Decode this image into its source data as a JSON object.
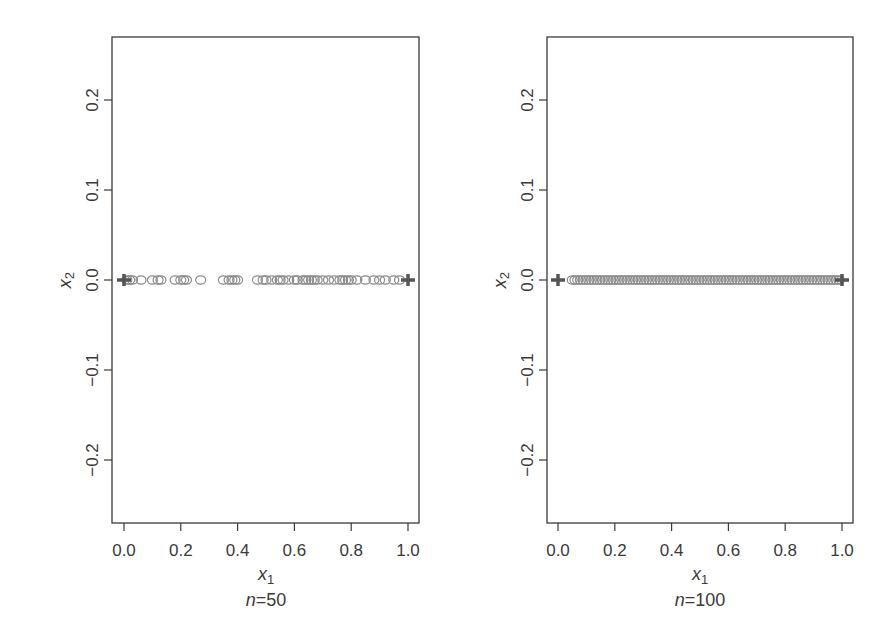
{
  "chart_data": [
    {
      "type": "scatter",
      "title": "",
      "caption": "n=50",
      "caption_n_label": "n",
      "caption_value": "=50",
      "xlabel": "x",
      "xlabel_sub": "1",
      "ylabel": "x",
      "ylabel_sub": "2",
      "xlim": [
        -0.04,
        1.04
      ],
      "ylim": [
        -0.27,
        0.27
      ],
      "x_ticks": [
        0.0,
        0.2,
        0.4,
        0.6,
        0.8,
        1.0
      ],
      "x_tick_labels": [
        "0.0",
        "0.2",
        "0.4",
        "0.6",
        "0.8",
        "1.0"
      ],
      "y_ticks": [
        -0.2,
        -0.1,
        0.0,
        0.1,
        0.2
      ],
      "y_tick_labels": [
        "−0.2",
        "−0.1",
        "0.0",
        "0.1",
        "0.2"
      ],
      "grid": false,
      "series": [
        {
          "name": "design points",
          "marker": "open-circle",
          "x": [
            0.01,
            0.02,
            0.03,
            0.06,
            0.1,
            0.12,
            0.13,
            0.18,
            0.2,
            0.21,
            0.22,
            0.27,
            0.35,
            0.37,
            0.38,
            0.39,
            0.4,
            0.47,
            0.49,
            0.5,
            0.52,
            0.54,
            0.55,
            0.56,
            0.58,
            0.6,
            0.61,
            0.63,
            0.64,
            0.65,
            0.66,
            0.67,
            0.68,
            0.7,
            0.72,
            0.74,
            0.76,
            0.77,
            0.78,
            0.79,
            0.8,
            0.82,
            0.85,
            0.88,
            0.9,
            0.92,
            0.95,
            0.97
          ],
          "y": 0.0
        },
        {
          "name": "boundary points",
          "marker": "plus",
          "x": [
            0.0,
            1.0
          ],
          "y": 0.0
        }
      ]
    },
    {
      "type": "scatter",
      "title": "",
      "caption": "n=100",
      "caption_n_label": "n",
      "caption_value": "=100",
      "xlabel": "x",
      "xlabel_sub": "1",
      "ylabel": "x",
      "ylabel_sub": "2",
      "xlim": [
        -0.04,
        1.04
      ],
      "ylim": [
        -0.27,
        0.27
      ],
      "x_ticks": [
        0.0,
        0.2,
        0.4,
        0.6,
        0.8,
        1.0
      ],
      "x_tick_labels": [
        "0.0",
        "0.2",
        "0.4",
        "0.6",
        "0.8",
        "1.0"
      ],
      "y_ticks": [
        -0.2,
        -0.1,
        0.0,
        0.1,
        0.2
      ],
      "y_tick_labels": [
        "−0.2",
        "−0.1",
        "0.0",
        "0.1",
        "0.2"
      ],
      "grid": false,
      "series": [
        {
          "name": "design points",
          "marker": "open-circle",
          "x_range": [
            0.05,
            0.99
          ],
          "count": 98,
          "y": 0.0
        },
        {
          "name": "boundary points",
          "marker": "plus",
          "x": [
            0.0,
            1.0
          ],
          "y": 0.0
        }
      ]
    }
  ],
  "colors": {
    "axis": "#3a3a3a",
    "circle_stroke": "#8a8a8a",
    "plus": "#555555"
  }
}
